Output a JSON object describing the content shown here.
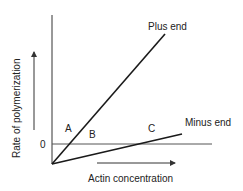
{
  "diagram": {
    "type": "line-graph-schematic",
    "y_axis_label": "Rate of polymerization",
    "x_axis_label": "Actin concentration",
    "zero_tick_label": "0",
    "lines": [
      {
        "name": "Plus end",
        "label": "Plus end",
        "color": "#1a1a1a"
      },
      {
        "name": "Minus end",
        "label": "Minus end",
        "color": "#1a1a1a"
      }
    ],
    "points": [
      {
        "label": "A"
      },
      {
        "label": "B"
      },
      {
        "label": "C"
      }
    ],
    "colors": {
      "line": "#1a1a1a",
      "axis": "#333333",
      "zero_line": "#555555",
      "text": "#222222",
      "background": "#ffffff"
    }
  }
}
